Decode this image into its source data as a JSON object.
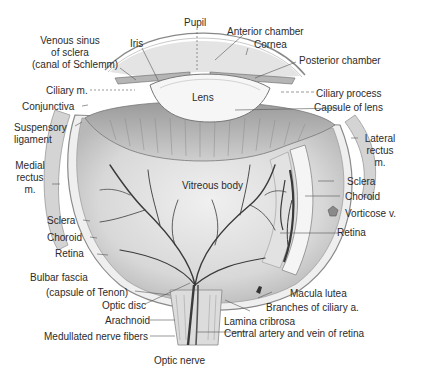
{
  "figure": {
    "colors": {
      "background": "#ffffff",
      "tissue_light": "#e6e6e6",
      "tissue_mid": "#bdbdbd",
      "tissue_dark": "#7a7a7a",
      "vessel": "#3a3a3a",
      "label_text": "#2b2b2b",
      "leader_line": "#555555"
    }
  },
  "labels": {
    "pupil": "Pupil",
    "anterior_chamber": "Anterior chamber",
    "cornea": "Cornea",
    "posterior_chamber": "Posterior chamber",
    "iris": "Iris",
    "venous_sinus_1": "Venous sinus",
    "venous_sinus_2": "of sclera",
    "venous_sinus_3": "(canal of Schlemm)",
    "ciliary_m": "Ciliary m.",
    "conjunctiva": "Conjunctiva",
    "lens": "Lens",
    "ciliary_process": "Ciliary process",
    "capsule_of_lens": "Capsule of lens",
    "suspensory_1": "Suspensory",
    "suspensory_2": "ligament",
    "medial_rectus_1": "Medial",
    "medial_rectus_2": "rectus",
    "medial_rectus_3": "m.",
    "lateral_rectus_1": "Lateral",
    "lateral_rectus_2": "rectus",
    "lateral_rectus_3": "m.",
    "vitreous_body": "Vitreous body",
    "sclera_right": "Sclera",
    "choroid_right": "Choroid",
    "vorticose_v": "Vorticose v.",
    "retina_right": "Retina",
    "sclera_left": "Sclera",
    "choroid_left": "Choroid",
    "retina_left": "Retina",
    "bulbar_fascia_1": "Bulbar fascia",
    "bulbar_fascia_2": "(capsule of Tenon)",
    "optic_disc": "Optic disc",
    "arachnoid": "Arachnoid",
    "medullated_nerve_fibers": "Medullated nerve fibers",
    "macula_lutea": "Macula lutea",
    "branches_ciliary_a": "Branches of ciliary a.",
    "lamina_cribrosa": "Lamina cribrosa",
    "central_artery_vein": "Central artery and vein of retina",
    "optic_nerve": "Optic nerve"
  }
}
